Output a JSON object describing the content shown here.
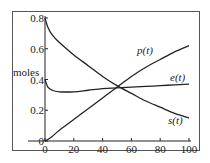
{
  "chart_data": {
    "type": "line",
    "title": "",
    "xlabel": "",
    "ylabel": "moles",
    "xlim": [
      0,
      100
    ],
    "ylim": [
      0,
      0.8
    ],
    "x_ticks": [
      "0",
      "20",
      "40",
      "60",
      "80",
      "100"
    ],
    "y_ticks": [
      "0",
      "0.2",
      "0.4",
      "0.6",
      "0.8"
    ],
    "grid": false,
    "legend": "inline labels",
    "x": [
      0,
      2,
      5,
      10,
      20,
      30,
      40,
      50,
      60,
      70,
      80,
      90,
      100
    ],
    "series": [
      {
        "name": "s(t)",
        "label": "s(t)",
        "values": [
          0.8,
          0.74,
          0.69,
          0.64,
          0.56,
          0.49,
          0.42,
          0.36,
          0.31,
          0.26,
          0.22,
          0.18,
          0.15
        ]
      },
      {
        "name": "e(t)",
        "label": "e(t)",
        "values": [
          0.4,
          0.35,
          0.33,
          0.32,
          0.32,
          0.33,
          0.34,
          0.345,
          0.35,
          0.355,
          0.36,
          0.365,
          0.37
        ]
      },
      {
        "name": "p(t)",
        "label": "p(t)",
        "values": [
          0.0,
          0.01,
          0.03,
          0.07,
          0.14,
          0.21,
          0.28,
          0.35,
          0.42,
          0.48,
          0.53,
          0.58,
          0.62
        ]
      }
    ]
  },
  "labels": {
    "ylabel": "moles",
    "p": "p(t)",
    "e": "e(t)",
    "s": "s(t)"
  }
}
